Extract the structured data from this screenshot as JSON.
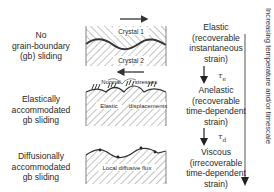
{
  "mechanisms": [
    {
      "lines": [
        "No",
        "grain-boundary",
        "(gb) sliding"
      ]
    },
    {
      "lines": [
        "Elastically",
        "accommodated",
        "gb sliding"
      ]
    },
    {
      "lines": [
        "Diffusionally",
        "accommodated",
        "gb sliding"
      ]
    }
  ],
  "responses": [
    {
      "lines": [
        "Elastic",
        "(recoverable",
        "instantaneous",
        "strain)"
      ]
    },
    {
      "lines": [
        "Anelastic",
        "(recoverable",
        "time-dependent",
        "strain)"
      ]
    },
    {
      "lines": [
        "Viscous",
        "(irrecoverable",
        "time-dependent",
        "strain)"
      ]
    }
  ],
  "panels": {
    "crystal_top": "Crystal 1",
    "crystal_bottom": "Crystal 2",
    "normal_label": "Normal",
    "stresses_label": "stresses",
    "elastic_label": "Elastic",
    "displacements_label": "displacements",
    "diffusive_label": "Local diffusive flux"
  },
  "timescales": {
    "tau_e_symbol": "τ",
    "tau_e_sub": "e",
    "tau_d_symbol": "τ",
    "tau_d_sub": "d"
  },
  "axis_label": "Increasing temperature and/or timescale"
}
